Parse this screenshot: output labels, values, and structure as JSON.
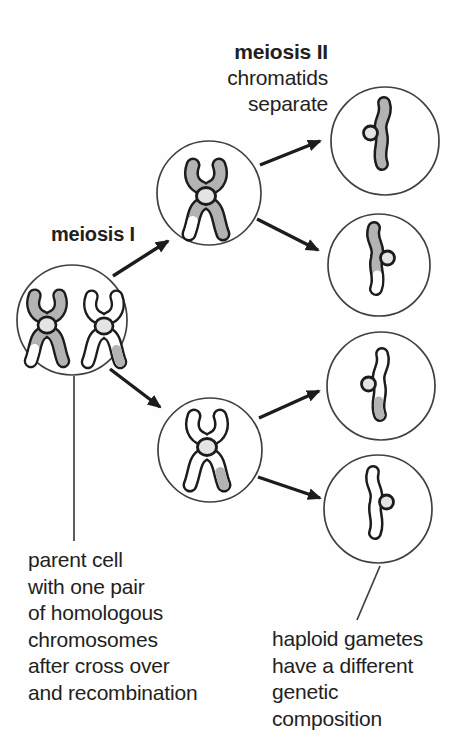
{
  "labels": {
    "meiosis1": "meiosis I",
    "meiosis2_title": "meiosis II",
    "meiosis2_subtitle": "chromatids\nseparate",
    "parent_caption": "parent cell\nwith one pair\nof homologous\nchromosomes\nafter cross over\nand recombination",
    "gametes_caption": "haploid gametes\nhave a different\ngenetic\ncomposition"
  },
  "colors": {
    "background": "#fefefe",
    "outline": "#1c1c1c",
    "chromatid_gray": "#b3b3b3",
    "chromatid_white": "#ffffff",
    "centromere_fill": "#e4e4e4",
    "cell_stroke": "#404040",
    "text": "#231f20"
  },
  "cells": [
    {
      "id": "parent-cell",
      "contents": "one gray and one white homologous chromosome, each with one recombinant tip"
    },
    {
      "id": "meiosis1-top-cell",
      "contents": "gray chromosome with white tip on one chromatid"
    },
    {
      "id": "meiosis1-bottom-cell",
      "contents": "white chromosome with gray tip on one chromatid"
    },
    {
      "id": "gamete-1",
      "contents": "gray chromatid"
    },
    {
      "id": "gamete-2",
      "contents": "gray chromatid with white tip"
    },
    {
      "id": "gamete-3",
      "contents": "white chromatid with gray tip"
    },
    {
      "id": "gamete-4",
      "contents": "white chromatid"
    }
  ]
}
